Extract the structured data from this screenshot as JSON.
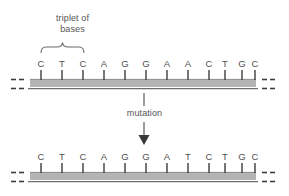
{
  "figure": {
    "title_caption_line1": "triplet of",
    "title_caption_line2": "bases",
    "process_label": "mutation",
    "colors": {
      "text": "#555555",
      "base_letter": "#4f4f4f",
      "tick": "#3d3d3d",
      "strand_fill": "#b4b4b4",
      "strand_edge": "#6e6e6e",
      "brace": "#6a6a6a",
      "arrow": "#5a5a5a",
      "background": "#ffffff"
    },
    "strands": [
      {
        "name": "original-strand",
        "bases": [
          "C",
          "T",
          "C",
          "A",
          "G",
          "G",
          "A",
          "A",
          "C",
          "T",
          "G",
          "C"
        ],
        "continues_left": true,
        "continues_right": true
      },
      {
        "name": "mutated-strand",
        "bases": [
          "C",
          "T",
          "C",
          "A",
          "G",
          "G",
          "A",
          "T",
          "C",
          "T",
          "G",
          "C"
        ],
        "continues_left": true,
        "continues_right": true
      }
    ],
    "brace": {
      "name": "triplet-brace",
      "covers_base_indices": [
        0,
        1,
        2
      ]
    },
    "mutation": {
      "position_index": 7,
      "from_base": "A",
      "to_base": "T"
    }
  }
}
